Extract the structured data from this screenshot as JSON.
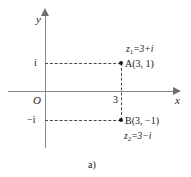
{
  "figure": {
    "caption": "a)",
    "axes": {
      "x_label": "x",
      "y_label": "y",
      "origin_label": "O"
    },
    "tick_labels": {
      "imaginary_positive": "i",
      "imaginary_negative": "−i",
      "real_three": "3"
    },
    "points": [
      {
        "name": "A",
        "label": "A(3, 1)",
        "x": 3,
        "y": 1
      },
      {
        "name": "B",
        "label": "B(3, −1)",
        "x": 3,
        "y": -1
      }
    ],
    "equations": {
      "z1_var": "z",
      "z1_sub": "1",
      "z1_rhs": "=3+i",
      "z2_var": "z",
      "z2_sub": "2",
      "z2_rhs": "=3−i"
    },
    "colors": {
      "axis": "#8a8a8a",
      "dashed_guide": "#4a4a4a",
      "point": "#1a1a1a",
      "text": "#1a1a1a",
      "background": "#ffffff"
    }
  },
  "chart_data": {
    "type": "scatter",
    "title": "",
    "xlabel": "x",
    "ylabel": "y",
    "xlim": [
      -1.2,
      4.6
    ],
    "ylim": [
      -2.1,
      2.3
    ],
    "grid": false,
    "legend": null,
    "points": [
      {
        "label": "A(3, 1)",
        "x": 3,
        "y": 1,
        "annotation": "z1=3+i"
      },
      {
        "label": "B(3, −1)",
        "x": 3,
        "y": -1,
        "annotation": "z2=3−i"
      }
    ],
    "x_ticks": [
      {
        "value": 3,
        "label": "3"
      }
    ],
    "y_ticks": [
      {
        "value": 1,
        "label": "i"
      },
      {
        "value": -1,
        "label": "−i"
      }
    ],
    "annotations": [
      "z1=3+i",
      "z2=3−i",
      "O"
    ],
    "guide_lines": [
      {
        "from": [
          0,
          1
        ],
        "to": [
          3,
          1
        ],
        "style": "dashed"
      },
      {
        "from": [
          0,
          -1
        ],
        "to": [
          3,
          -1
        ],
        "style": "dashed"
      },
      {
        "from": [
          3,
          1
        ],
        "to": [
          3,
          -1
        ],
        "style": "dashed"
      }
    ]
  }
}
